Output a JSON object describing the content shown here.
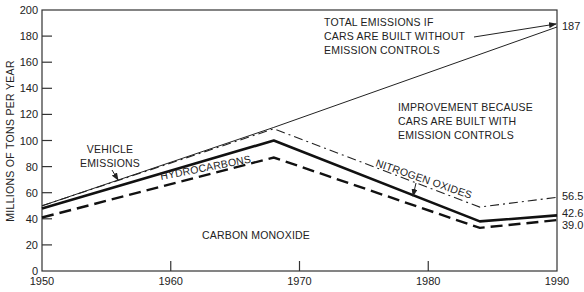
{
  "chart_data": {
    "type": "line",
    "title": "",
    "xlabel": "",
    "ylabel": "MILLIONS OF TONS PER YEAR",
    "xlim": [
      1950,
      1990
    ],
    "ylim": [
      0,
      200
    ],
    "grid": false,
    "x_ticks": [
      1950,
      1960,
      1970,
      1980,
      1990
    ],
    "y_ticks": [
      0,
      20,
      40,
      60,
      80,
      100,
      120,
      140,
      160,
      180,
      200
    ],
    "series": [
      {
        "name": "Total emissions if cars are built without emission controls",
        "style": "thin-solid",
        "x": [
          1950,
          1968,
          1990
        ],
        "values": [
          50,
          110,
          187
        ]
      },
      {
        "name": "Nitrogen oxides",
        "style": "dash-dot",
        "x": [
          1950,
          1968,
          1984,
          1990
        ],
        "values": [
          50,
          109,
          49,
          56.5
        ]
      },
      {
        "name": "Hydrocarbons",
        "style": "thick-solid",
        "x": [
          1950,
          1968,
          1984,
          1990
        ],
        "values": [
          48,
          100,
          38,
          42.6
        ]
      },
      {
        "name": "Carbon monoxide",
        "style": "dashed",
        "x": [
          1950,
          1968,
          1984,
          1990
        ],
        "values": [
          41,
          87,
          33,
          39.0
        ]
      }
    ],
    "end_labels": [
      "187",
      "56.5",
      "42.6",
      "39.0"
    ],
    "annotations": {
      "total": [
        "TOTAL EMISSIONS IF",
        "CARS ARE BUILT WITHOUT",
        "EMISSION CONTROLS"
      ],
      "improvement": [
        "IMPROVEMENT BECAUSE",
        "CARS ARE BUILT WITH",
        "EMISSION CONTROLS"
      ],
      "vehicle": [
        "VEHICLE",
        "EMISSIONS"
      ],
      "hydrocarbons": "HYDROCARBONS",
      "nitrogen": "NITROGEN OXIDES",
      "carbon": "CARBON MONOXIDE"
    }
  }
}
